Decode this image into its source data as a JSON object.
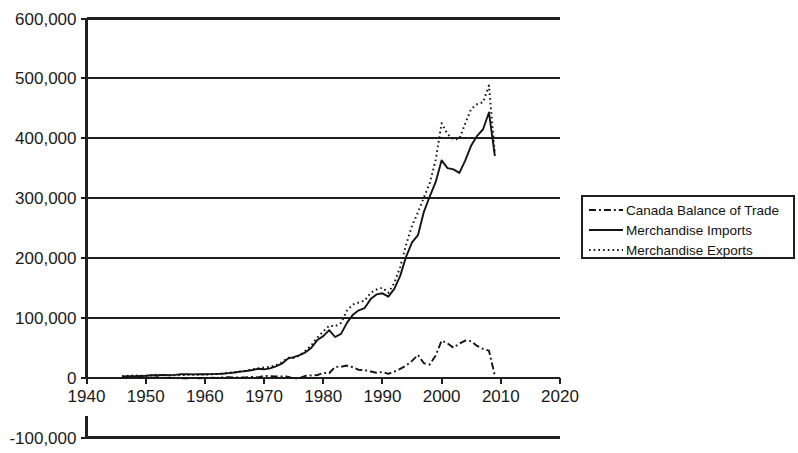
{
  "chart_data": {
    "type": "line",
    "title": "",
    "subtitle": "",
    "xlabel": "",
    "ylabel": "",
    "xlim": [
      1940,
      2020
    ],
    "ylim": [
      -100000,
      600000
    ],
    "x_ticks": [
      1940,
      1950,
      1960,
      1970,
      1980,
      1990,
      2000,
      2010,
      2020
    ],
    "y_ticks": [
      -100000,
      0,
      100000,
      200000,
      300000,
      400000,
      500000,
      600000
    ],
    "y_tick_labels": [
      "-100,000",
      "0",
      "100,000",
      "200,000",
      "300,000",
      "400,000",
      "500,000",
      "600,000"
    ],
    "x_tick_labels": [
      "1940",
      "1950",
      "1960",
      "1970",
      "1980",
      "1990",
      "2000",
      "2010",
      "2020"
    ],
    "grid": true,
    "grid_axis": "y",
    "legend_position": "right",
    "units_note": "",
    "x": [
      1946,
      1947,
      1948,
      1949,
      1950,
      1951,
      1952,
      1953,
      1954,
      1955,
      1956,
      1957,
      1958,
      1959,
      1960,
      1961,
      1962,
      1963,
      1964,
      1965,
      1966,
      1967,
      1968,
      1969,
      1970,
      1971,
      1972,
      1973,
      1974,
      1975,
      1976,
      1977,
      1978,
      1979,
      1980,
      1981,
      1982,
      1983,
      1984,
      1985,
      1986,
      1987,
      1988,
      1989,
      1990,
      1991,
      1992,
      1993,
      1994,
      1995,
      1996,
      1997,
      1998,
      1999,
      2000,
      2001,
      2002,
      2003,
      2004,
      2005,
      2006,
      2007,
      2008,
      2009
    ],
    "series": [
      {
        "name": "Canada Balance of Trade",
        "style": "dash-dot",
        "color": "#141414",
        "values": [
          600,
          400,
          900,
          500,
          -200,
          -400,
          900,
          -400,
          -200,
          -700,
          -1300,
          -1100,
          -700,
          -900,
          -600,
          -300,
          -400,
          300,
          700,
          200,
          300,
          500,
          1100,
          500,
          3000,
          2600,
          1900,
          2000,
          1700,
          -1500,
          -600,
          2900,
          3800,
          4200,
          7800,
          7300,
          17900,
          18200,
          20200,
          17400,
          13000,
          12500,
          10300,
          8200,
          9400,
          6400,
          10000,
          14700,
          20000,
          28000,
          38000,
          24000,
          22000,
          37000,
          62000,
          57000,
          50000,
          57000,
          62000,
          61000,
          53000,
          48000,
          45000,
          3000
        ]
      },
      {
        "name": "Merchandise Imports",
        "style": "solid",
        "color": "#141414",
        "values": [
          1800,
          2600,
          2600,
          2800,
          3100,
          4100,
          4000,
          4400,
          4200,
          4700,
          5700,
          5800,
          5400,
          5900,
          5700,
          5900,
          6300,
          6600,
          7500,
          8600,
          10100,
          11100,
          12700,
          14900,
          13900,
          15400,
          18700,
          23300,
          31700,
          34400,
          37500,
          42300,
          50100,
          62800,
          69300,
          79500,
          67900,
          73100,
          91500,
          104900,
          112500,
          116200,
          131200,
          139000,
          140900,
          135300,
          148300,
          170000,
          202000,
          226000,
          238000,
          277000,
          303000,
          327000,
          363000,
          350000,
          348000,
          342000,
          363000,
          388000,
          404000,
          415000,
          443000,
          370000
        ]
      },
      {
        "name": "Merchandise Exports",
        "style": "dotted",
        "color": "#141414",
        "values": [
          2400,
          3000,
          3500,
          3300,
          2900,
          3700,
          4900,
          4000,
          4000,
          4000,
          4400,
          4700,
          4700,
          5000,
          5100,
          5600,
          5900,
          6900,
          8200,
          8800,
          10400,
          11600,
          13800,
          15400,
          16900,
          18000,
          20600,
          25300,
          33400,
          32900,
          36900,
          45200,
          53900,
          67000,
          77100,
          86800,
          85800,
          91300,
          111700,
          122300,
          125500,
          128700,
          141500,
          147200,
          150300,
          141700,
          158300,
          184700,
          222000,
          254000,
          276000,
          301000,
          325000,
          364000,
          425000,
          407000,
          398000,
          399000,
          425000,
          449000,
          457000,
          460000,
          488000,
          373000
        ]
      }
    ]
  },
  "legend": {
    "items": [
      {
        "label": "Canada Balance of Trade",
        "style": "dash-dot"
      },
      {
        "label": "Merchandise Imports",
        "style": "solid"
      },
      {
        "label": "Merchandise Exports",
        "style": "dotted"
      }
    ]
  }
}
